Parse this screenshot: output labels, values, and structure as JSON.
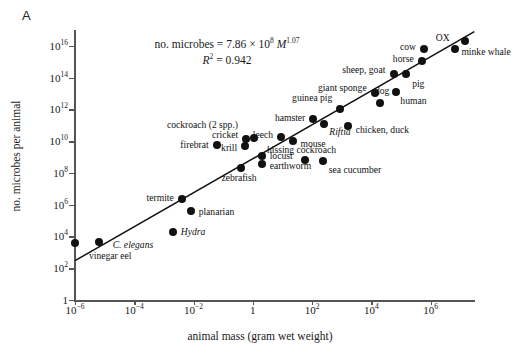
{
  "figure": {
    "panel_letter": "A",
    "equation_line1_pre": "no. microbes = 7.86 × 10",
    "equation_exp1": "8",
    "equation_var": "M",
    "equation_exp2": "1.07",
    "equation_line2_pre": "R",
    "equation_line2_sup": "2",
    "equation_line2_post": " = 0.942"
  },
  "chart_data": {
    "type": "scatter",
    "title": "",
    "xlabel": "animal mass (gram wet weight)",
    "ylabel": "no. microbes per animal",
    "xscale": "log",
    "yscale": "log",
    "xlim": [
      1e-06,
      31600000.0
    ],
    "ylim": [
      1,
      1e+17
    ],
    "grid": false,
    "legend": "none",
    "annotations": [
      "no. microbes = 7.86 × 10^8 M^1.07",
      "R^2 = 0.942"
    ],
    "fit": {
      "intercept_coefficient": 786000000.0,
      "exponent": 1.07,
      "r_squared": 0.942,
      "x_start": 1e-06,
      "x_end": 30000000.0
    },
    "xticks": [
      {
        "value": 1e-06,
        "label_mantissa": "10",
        "label_exp": "−6"
      },
      {
        "value": 0.0001,
        "label_mantissa": "10",
        "label_exp": "−4"
      },
      {
        "value": 0.01,
        "label_mantissa": "10",
        "label_exp": "−2"
      },
      {
        "value": 1,
        "label_mantissa": "1",
        "label_exp": ""
      },
      {
        "value": 100.0,
        "label_mantissa": "10",
        "label_exp": "2"
      },
      {
        "value": 10000.0,
        "label_mantissa": "10",
        "label_exp": "4"
      },
      {
        "value": 1000000.0,
        "label_mantissa": "10",
        "label_exp": "6"
      }
    ],
    "yticks": [
      {
        "value": 1,
        "label_mantissa": "1",
        "label_exp": ""
      },
      {
        "value": 100.0,
        "label_mantissa": "10",
        "label_exp": "2"
      },
      {
        "value": 10000.0,
        "label_mantissa": "10",
        "label_exp": "4"
      },
      {
        "value": 1000000.0,
        "label_mantissa": "10",
        "label_exp": "6"
      },
      {
        "value": 100000000.0,
        "label_mantissa": "10",
        "label_exp": "8"
      },
      {
        "value": 10000000000.0,
        "label_mantissa": "10",
        "label_exp": "10"
      },
      {
        "value": 1000000000000.0,
        "label_mantissa": "10",
        "label_exp": "12"
      },
      {
        "value": 100000000000000.0,
        "label_mantissa": "10",
        "label_exp": "14"
      },
      {
        "value": 1e+16,
        "label_mantissa": "10",
        "label_exp": "16"
      }
    ],
    "points": [
      {
        "name": "vinegar eel",
        "x": 1e-06,
        "y": 4000.0,
        "label": "vinegar eel",
        "lx": 14,
        "ly": 13,
        "italic": false,
        "anchor": "left"
      },
      {
        "name": "C. elegans",
        "x": 6.3e-06,
        "y": 4500.0,
        "label": "C. elegans",
        "lx": 14,
        "ly": 3,
        "italic": true,
        "anchor": "left"
      },
      {
        "name": "Hydra",
        "x": 0.002,
        "y": 20000.0,
        "label": "Hydra",
        "lx": 8,
        "ly": 0,
        "italic": true,
        "anchor": "left"
      },
      {
        "name": "planarian",
        "x": 0.008,
        "y": 400000.0,
        "label": "planarian",
        "lx": 8,
        "ly": 1,
        "italic": false,
        "anchor": "left"
      },
      {
        "name": "termite",
        "x": 0.004,
        "y": 2200000.0,
        "label": "termite",
        "lx": -8,
        "ly": -1,
        "italic": false,
        "anchor": "right"
      },
      {
        "name": "zebrafish",
        "x": 0.4,
        "y": 200000000.0,
        "label": "zebrafish",
        "lx": -2,
        "ly": 10,
        "italic": false,
        "anchor": "center"
      },
      {
        "name": "firebrat",
        "x": 0.06,
        "y": 5500000000.0,
        "label": "firebrat",
        "lx": -8,
        "ly": 0,
        "italic": false,
        "anchor": "right"
      },
      {
        "name": "krill",
        "x": 0.55,
        "y": 5000000000.0,
        "label": "krill",
        "lx": -8,
        "ly": 2,
        "italic": false,
        "anchor": "right"
      },
      {
        "name": "cricket",
        "x": 0.6,
        "y": 14000000000.0,
        "label": "cricket",
        "lx": -8,
        "ly": -4,
        "italic": false,
        "anchor": "right"
      },
      {
        "name": "cockroach (2 spp.)",
        "x": 1.1,
        "y": 17000000000.0,
        "label": "cockroach (2 spp.)",
        "lx": -16,
        "ly": -13,
        "italic": false,
        "anchor": "right"
      },
      {
        "name": "locust",
        "x": 2.0,
        "y": 1200000000.0,
        "label": "locust",
        "lx": 8,
        "ly": 0,
        "italic": false,
        "anchor": "left"
      },
      {
        "name": "earthworm",
        "x": 2.0,
        "y": 360000000.0,
        "label": "earthworm",
        "lx": 8,
        "ly": 2,
        "italic": false,
        "anchor": "left"
      },
      {
        "name": "leech",
        "x": 9.0,
        "y": 18000000000.0,
        "label": "leech",
        "lx": -8,
        "ly": -2,
        "italic": false,
        "anchor": "right"
      },
      {
        "name": "mouse",
        "x": 22.0,
        "y": 10000000000.0,
        "label": "mouse",
        "lx": 8,
        "ly": 3,
        "italic": false,
        "anchor": "left"
      },
      {
        "name": "hissing cockroach",
        "x": 60.0,
        "y": 700000000.0,
        "label": "hissing cockroach",
        "lx": -4,
        "ly": -10,
        "italic": false,
        "anchor": "center"
      },
      {
        "name": "sea cucumber",
        "x": 230.0,
        "y": 600000000.0,
        "label": "sea cucumber",
        "lx": 6,
        "ly": 9,
        "italic": false,
        "anchor": "left"
      },
      {
        "name": "hamster",
        "x": 110.0,
        "y": 260000000000.0,
        "label": "hamster",
        "lx": -8,
        "ly": -1,
        "italic": false,
        "anchor": "right"
      },
      {
        "name": "Riftia",
        "x": 260.0,
        "y": 120000000000.0,
        "label": "Riftia",
        "lx": 5,
        "ly": 8,
        "italic": true,
        "anchor": "left"
      },
      {
        "name": "guinea pig",
        "x": 900.0,
        "y": 1100000000000.0,
        "label": "guinea pig",
        "lx": -8,
        "ly": -11,
        "italic": false,
        "anchor": "right"
      },
      {
        "name": "chicken, duck",
        "x": 1600.0,
        "y": 90000000000.0,
        "label": "chicken, duck",
        "lx": 8,
        "ly": 4,
        "italic": false,
        "anchor": "left"
      },
      {
        "name": "giant sponge",
        "x": 13000.0,
        "y": 11000000000000.0,
        "label": "giant sponge",
        "lx": -8,
        "ly": -5,
        "italic": false,
        "anchor": "right"
      },
      {
        "name": "dog",
        "x": 20000.0,
        "y": 2600000000000.0,
        "label": "dog",
        "lx": 2,
        "ly": -12,
        "italic": false,
        "anchor": "center"
      },
      {
        "name": "human",
        "x": 70000.0,
        "y": 12000000000000.0,
        "label": "human",
        "lx": 4,
        "ly": 9,
        "italic": false,
        "anchor": "left"
      },
      {
        "name": "sheep, goat",
        "x": 60000.0,
        "y": 160000000000000.0,
        "label": "sheep, goat",
        "lx": -9,
        "ly": -4,
        "italic": false,
        "anchor": "right"
      },
      {
        "name": "pig",
        "x": 150000.0,
        "y": 170000000000000.0,
        "label": "pig",
        "lx": 6,
        "ly": 10,
        "italic": false,
        "anchor": "left"
      },
      {
        "name": "horse",
        "x": 500000.0,
        "y": 1100000000000000.0,
        "label": "horse",
        "lx": -8,
        "ly": -2,
        "italic": false,
        "anchor": "right"
      },
      {
        "name": "cow",
        "x": 600000.0,
        "y": 6000000000000000.0,
        "label": "cow",
        "lx": -8,
        "ly": -2,
        "italic": false,
        "anchor": "right"
      },
      {
        "name": "ox",
        "x": 6500000.0,
        "y": 6500000000000000.0,
        "label": "OX",
        "lx": -5,
        "ly": -11,
        "italic": false,
        "anchor": "right"
      },
      {
        "name": "minke whale",
        "x": 15000000.0,
        "y": 2e+16,
        "label": "minke whale",
        "lx": -4,
        "ly": 11,
        "italic": false,
        "anchor": "left"
      }
    ]
  }
}
